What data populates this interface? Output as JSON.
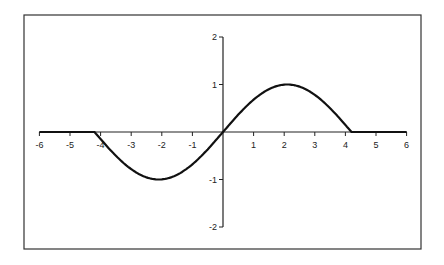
{
  "chart_data": {
    "type": "line",
    "title": "",
    "xlabel": "",
    "ylabel": "",
    "xlim": [
      -6,
      6
    ],
    "ylim": [
      -2,
      2
    ],
    "grid": false,
    "legend": null,
    "x_ticks": [
      -6,
      -5,
      -4,
      -3,
      -2,
      -1,
      1,
      2,
      3,
      4,
      5,
      6
    ],
    "y_ticks": [
      2,
      1,
      -1,
      -2
    ],
    "series": [
      {
        "name": "f(x)",
        "description": "sin(pi*x/4.2) for |x| <= 4.2, 0 otherwise",
        "x": [
          -6,
          -5,
          -4.2,
          -3,
          -2.1,
          -1,
          0,
          1,
          2.1,
          3,
          4.2,
          5,
          6
        ],
        "y": [
          0,
          0,
          0,
          -0.78,
          -1,
          -0.68,
          0,
          0.68,
          1,
          0.78,
          0,
          0,
          0
        ],
        "color": "#111111"
      }
    ]
  }
}
